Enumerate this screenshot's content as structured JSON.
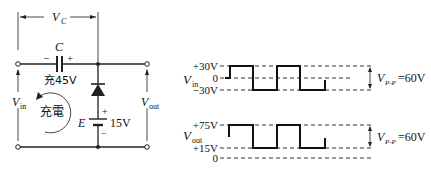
{
  "circuit": {
    "vc_label": "V",
    "vc_sub": "C",
    "capacitor_label": "C",
    "cap_minus": "−",
    "cap_plus": "+",
    "cap_charge": "充45V",
    "loop_label": "充電",
    "vin_label": "V",
    "vin_sub": "in",
    "vout_label": "V",
    "vout_sub": "out",
    "battery_label": "E",
    "battery_value": "15V",
    "battery_plus": "+",
    "battery_minus": "−"
  },
  "input_wave": {
    "label": "V",
    "label_sub": "in",
    "levels": [
      "+30V",
      "0",
      "−30V"
    ],
    "vpp_label": "V",
    "vpp_sub": "P-P",
    "vpp_value": "=60V"
  },
  "output_wave": {
    "label": "V",
    "label_sub": "out",
    "levels": [
      "+75V",
      "+15V",
      "0"
    ],
    "vpp_label": "V",
    "vpp_sub": "P-P",
    "vpp_value": "=60V"
  },
  "colors": {
    "line": "#222222",
    "background": "#ffffff"
  }
}
